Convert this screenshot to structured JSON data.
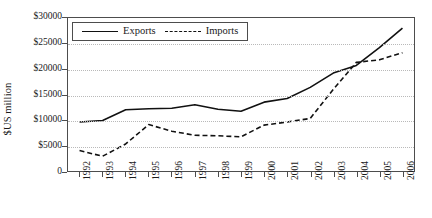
{
  "chart_data": {
    "type": "line",
    "title": "",
    "xlabel": "",
    "ylabel": "$US million",
    "categories": [
      "1992",
      "1993",
      "1994",
      "1995",
      "1996",
      "1997",
      "1998",
      "1999",
      "2000",
      "2001",
      "2002",
      "2003",
      "2004",
      "2005",
      "2006"
    ],
    "ylim": [
      0,
      30000
    ],
    "ytick_values": [
      0,
      5000,
      10000,
      15000,
      20000,
      25000,
      30000
    ],
    "ytick_labels": [
      "0",
      "$5000",
      "$10000",
      "$15000",
      "$20000",
      "$25000",
      "$30000"
    ],
    "grid": true,
    "legend_position": "top-left-inside",
    "series": [
      {
        "name": "Exports",
        "style": "solid",
        "color": "#111111",
        "values": [
          9600,
          9900,
          12000,
          12200,
          12300,
          13000,
          12100,
          11700,
          13500,
          14200,
          16400,
          19200,
          20700,
          24200,
          28000
        ]
      },
      {
        "name": "Imports",
        "style": "dashed",
        "color": "#111111",
        "values": [
          4000,
          2900,
          5300,
          9100,
          7800,
          7000,
          6900,
          6700,
          9000,
          9600,
          10300,
          16000,
          21300,
          21800,
          23200
        ]
      }
    ]
  }
}
